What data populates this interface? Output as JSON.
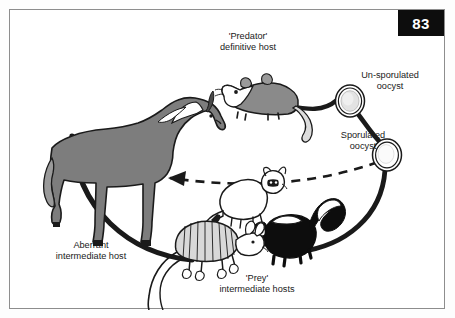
{
  "page": {
    "number_badge": "83",
    "top_cut_text": "",
    "background_color": "#ffffff",
    "frame_color": "#8d8d8d",
    "ink_color": "#1a1a1a"
  },
  "diagram": {
    "type": "life-cycle-diagram",
    "title_labels": {
      "predator": "'Predator'\ndefinitive host",
      "unsporulated_oocyst": "Un-sporulated\noocyst",
      "sporulated_oocyst": "Sporulated\noocyst",
      "aberrant_host": "Aberrant\nintermediate host",
      "prey_hosts": "'Prey'\nintermediate hosts"
    },
    "nodes": [
      {
        "id": "opossum",
        "icon": "opossum-icon",
        "label_ref": "predator",
        "role": "definitive host",
        "fill": "#7d7d7d",
        "x": 253,
        "y": 78
      },
      {
        "id": "unsporulated-oocyst",
        "icon": "oocyst-icon",
        "label_ref": "unsporulated_oocyst",
        "role": "un-sporulated oocyst shed in feces",
        "fill": "#e6e6e6",
        "x": 340,
        "y": 91
      },
      {
        "id": "sporulated-oocyst",
        "icon": "oocyst-icon",
        "label_ref": "sporulated_oocyst",
        "role": "sporulated infective oocyst",
        "fill": "#ffffff",
        "x": 376,
        "y": 145
      },
      {
        "id": "skunk",
        "icon": "skunk-icon",
        "label_ref": "prey_hosts",
        "role": "prey intermediate host",
        "fill": "#0d0d0d",
        "x": 287,
        "y": 228
      },
      {
        "id": "armadillo",
        "icon": "armadillo-icon",
        "label_ref": "prey_hosts",
        "role": "prey intermediate host",
        "fill": "#d8d8d8",
        "x": 205,
        "y": 242
      },
      {
        "id": "raccoon",
        "icon": "raccoon-icon",
        "label_ref": "prey_hosts",
        "role": "prey intermediate host",
        "fill": "#ffffff",
        "x": 232,
        "y": 192
      },
      {
        "id": "horse",
        "icon": "horse-icon",
        "label_ref": "aberrant_host",
        "role": "aberrant intermediate host",
        "fill": "#7d7d7d",
        "x": 100,
        "y": 175
      }
    ],
    "connectors": [
      {
        "id": "opossum-to-unsporulated",
        "style": "solid",
        "from": "opossum",
        "to": "unsporulated-oocyst",
        "arrow": false
      },
      {
        "id": "unsporulated-to-sporulated",
        "style": "solid",
        "from": "unsporulated-oocyst",
        "to": "sporulated-oocyst",
        "arrow": false
      },
      {
        "id": "sporulated-to-prey",
        "style": "solid",
        "from": "sporulated-oocyst",
        "to": "skunk",
        "arrow": false
      },
      {
        "id": "prey-to-opossum",
        "style": "solid",
        "from": "armadillo",
        "to": "opossum",
        "arrow": false
      },
      {
        "id": "sporulated-to-horse",
        "style": "dashed",
        "from": "sporulated-oocyst",
        "to": "horse",
        "arrow": true
      }
    ]
  }
}
